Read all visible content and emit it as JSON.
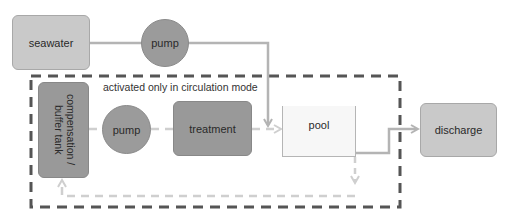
{
  "diagram": {
    "nodes": {
      "seawater": "seawater",
      "pump_top": "pump",
      "compensation_tank": "compensation / buffer tank",
      "pump_inner": "pump",
      "treatment": "treatment",
      "pool": "pool",
      "discharge": "discharge"
    },
    "group_label": "activated only in circulation mode",
    "colors": {
      "light_box": "#c9c9c9",
      "dark_box": "#999999",
      "pool_fill": "#f7f7f7",
      "solid_flow": "#b4b4b4",
      "dashed_flow": "#cfcfcf",
      "group_border": "#555555"
    },
    "edges": [
      {
        "from": "seawater",
        "to": "pump_top",
        "style": "solid"
      },
      {
        "from": "pump_top",
        "to": "pool",
        "style": "solid"
      },
      {
        "from": "compensation_tank",
        "to": "pump_inner",
        "style": "dashed"
      },
      {
        "from": "pump_inner",
        "to": "treatment",
        "style": "dashed"
      },
      {
        "from": "treatment",
        "to": "pool",
        "style": "dashed"
      },
      {
        "from": "pool",
        "to": "discharge",
        "style": "solid"
      },
      {
        "from": "pool",
        "to": "compensation_tank",
        "style": "dashed"
      }
    ]
  }
}
